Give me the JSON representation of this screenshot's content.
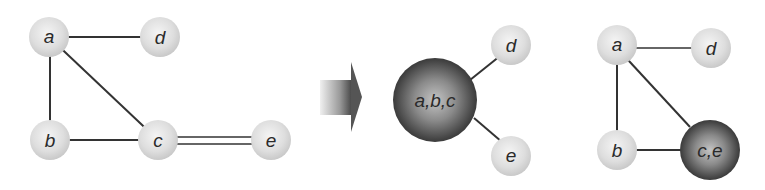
{
  "diagram": {
    "colors": {
      "node_light": "#d8d8d8",
      "node_light_highlight": "#f2f2f2",
      "node_dark": "#3c3c3c",
      "node_dark_highlight": "#bdbdbd",
      "edge": "#333333",
      "arrow": "#555555",
      "label": "#2a2a2a"
    },
    "left_graph": {
      "nodes": [
        {
          "id": "a",
          "label": "a"
        },
        {
          "id": "b",
          "label": "b"
        },
        {
          "id": "c",
          "label": "c"
        },
        {
          "id": "d",
          "label": "d"
        },
        {
          "id": "e",
          "label": "e"
        }
      ],
      "edges": [
        {
          "from": "a",
          "to": "d",
          "multiplicity": 1
        },
        {
          "from": "a",
          "to": "b",
          "multiplicity": 1
        },
        {
          "from": "a",
          "to": "c",
          "multiplicity": 1
        },
        {
          "from": "b",
          "to": "c",
          "multiplicity": 1
        },
        {
          "from": "c",
          "to": "e",
          "multiplicity": 2
        }
      ]
    },
    "arrow": {
      "direction": "right"
    },
    "middle_graph": {
      "nodes": [
        {
          "id": "abc",
          "label": "a,b,c",
          "merged": true
        },
        {
          "id": "d",
          "label": "d"
        },
        {
          "id": "e",
          "label": "e"
        }
      ],
      "edges": [
        {
          "from": "abc",
          "to": "d",
          "multiplicity": 1
        },
        {
          "from": "abc",
          "to": "e",
          "multiplicity": 1
        }
      ]
    },
    "right_graph": {
      "nodes": [
        {
          "id": "a",
          "label": "a"
        },
        {
          "id": "b",
          "label": "b"
        },
        {
          "id": "ce",
          "label": "c,e",
          "merged": true
        },
        {
          "id": "d",
          "label": "d"
        }
      ],
      "edges": [
        {
          "from": "a",
          "to": "d",
          "multiplicity": 1
        },
        {
          "from": "a",
          "to": "b",
          "multiplicity": 1
        },
        {
          "from": "a",
          "to": "ce",
          "multiplicity": 1
        },
        {
          "from": "b",
          "to": "ce",
          "multiplicity": 1
        }
      ]
    }
  }
}
